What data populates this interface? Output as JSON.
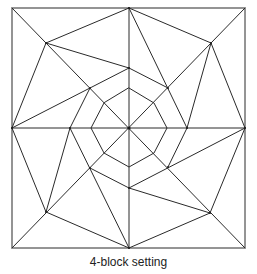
{
  "figure": {
    "caption": "4-block setting",
    "stroke_color": "#2a2a2a",
    "background": "#ffffff"
  },
  "geometry": {
    "outer_square": {
      "x1": 12,
      "y1": 8,
      "x2": 245,
      "y2": 248
    },
    "center": [
      129,
      128
    ],
    "octagon": [
      [
        129,
        88
      ],
      [
        154,
        103
      ],
      [
        167,
        128
      ],
      [
        154,
        153
      ],
      [
        129,
        167
      ],
      [
        104,
        153
      ],
      [
        91,
        128
      ],
      [
        104,
        103
      ]
    ],
    "lines": [
      [
        12,
        128,
        245,
        128
      ],
      [
        129,
        8,
        129,
        248
      ],
      [
        12,
        8,
        245,
        248
      ],
      [
        245,
        8,
        12,
        248
      ],
      [
        46,
        43,
        129,
        8
      ],
      [
        46,
        43,
        129,
        68
      ],
      [
        46,
        43,
        12,
        128
      ],
      [
        12,
        128,
        129,
        68
      ],
      [
        90,
        88,
        70,
        128
      ],
      [
        129,
        8,
        211,
        43
      ],
      [
        129,
        8,
        187,
        128
      ],
      [
        211,
        43,
        187,
        128
      ],
      [
        211,
        43,
        245,
        128
      ],
      [
        129,
        68,
        168,
        88
      ],
      [
        245,
        128,
        129,
        188
      ],
      [
        245,
        128,
        210,
        213
      ],
      [
        129,
        188,
        210,
        213
      ],
      [
        210,
        213,
        129,
        248
      ],
      [
        187,
        128,
        168,
        167
      ],
      [
        12,
        128,
        46,
        212
      ],
      [
        70,
        128,
        46,
        212
      ],
      [
        70,
        128,
        129,
        248
      ],
      [
        46,
        212,
        129,
        248
      ],
      [
        90,
        168,
        129,
        188
      ]
    ],
    "dots": [
      [
        129,
        128
      ],
      [
        46,
        43
      ],
      [
        211,
        43
      ],
      [
        46,
        212
      ],
      [
        210,
        213
      ],
      [
        129,
        8
      ],
      [
        12,
        128
      ],
      [
        245,
        128
      ],
      [
        129,
        248
      ],
      [
        129,
        68
      ],
      [
        187,
        128
      ],
      [
        129,
        188
      ],
      [
        70,
        128
      ],
      [
        90,
        88
      ],
      [
        168,
        88
      ],
      [
        168,
        167
      ],
      [
        90,
        168
      ]
    ]
  }
}
